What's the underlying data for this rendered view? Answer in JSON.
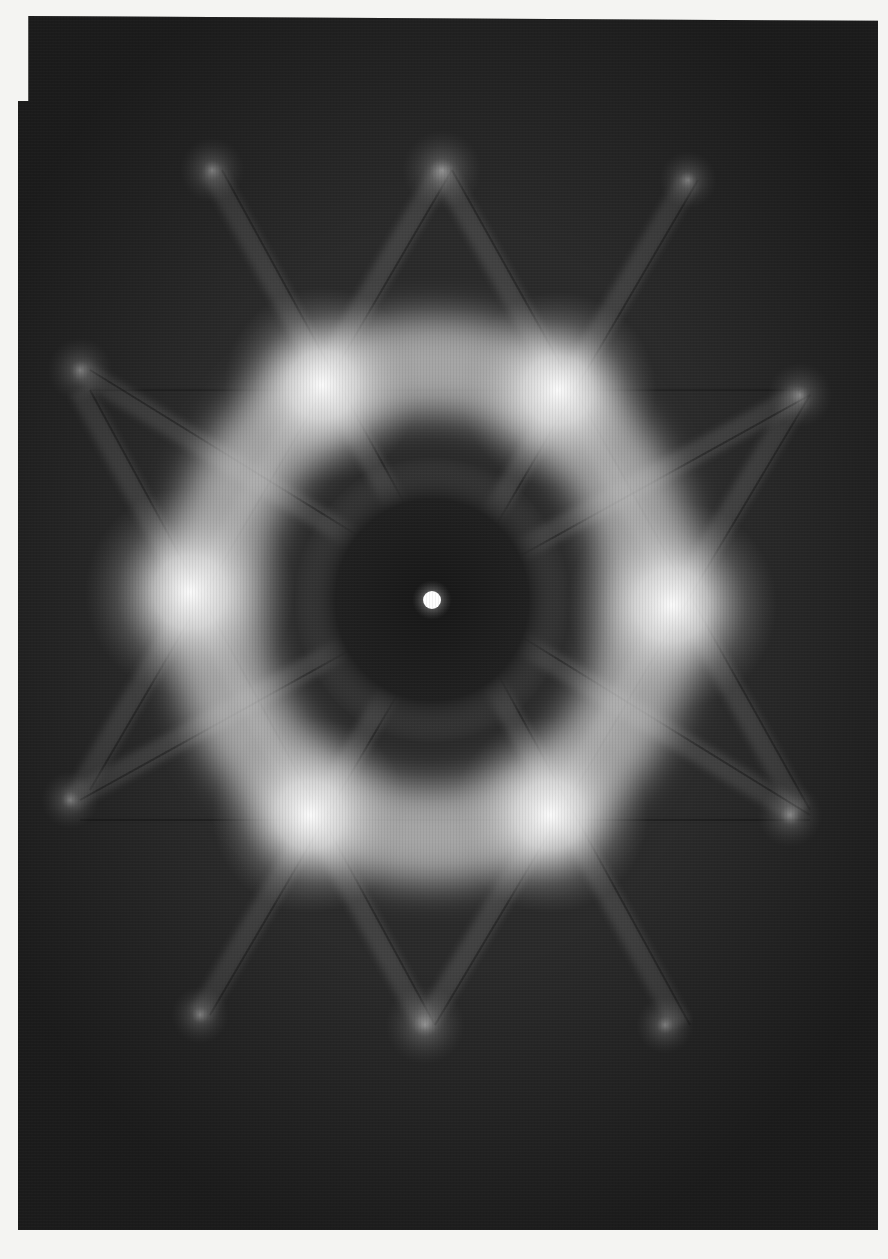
{
  "image": {
    "description": "Electron diffraction (Kikuchi) pattern with six-fold symmetry",
    "background_color": "#2a2a2a",
    "page_color": "#f4f4f2",
    "center": [
      432,
      600
    ],
    "central_spot": {
      "x": 432,
      "y": 600,
      "r": 9
    },
    "dark_core": {
      "x": 432,
      "y": 600,
      "rx": 120,
      "ry": 125,
      "color": "#1c1c1c"
    },
    "bright_ring": {
      "x": 432,
      "y": 600,
      "rx": 250,
      "ry": 265,
      "width": 95
    },
    "inner_spots": [
      {
        "x": 322,
        "y": 385,
        "r": 70
      },
      {
        "x": 558,
        "y": 390,
        "r": 70
      },
      {
        "x": 190,
        "y": 592,
        "r": 75
      },
      {
        "x": 672,
        "y": 605,
        "r": 75
      },
      {
        "x": 310,
        "y": 815,
        "r": 70
      },
      {
        "x": 550,
        "y": 815,
        "r": 70
      }
    ],
    "outer_spots": [
      {
        "x": 442,
        "y": 170,
        "r": 22
      },
      {
        "x": 212,
        "y": 170,
        "r": 18
      },
      {
        "x": 688,
        "y": 180,
        "r": 16
      },
      {
        "x": 80,
        "y": 370,
        "r": 18
      },
      {
        "x": 800,
        "y": 395,
        "r": 18
      },
      {
        "x": 70,
        "y": 800,
        "r": 16
      },
      {
        "x": 790,
        "y": 815,
        "r": 18
      },
      {
        "x": 200,
        "y": 1015,
        "r": 16
      },
      {
        "x": 425,
        "y": 1025,
        "r": 22
      },
      {
        "x": 665,
        "y": 1025,
        "r": 16
      }
    ],
    "kikuchi_lines": [
      [
        442,
        170,
        80,
        790
      ],
      [
        442,
        170,
        800,
        810
      ],
      [
        80,
        390,
        790,
        390
      ],
      [
        70,
        820,
        800,
        820
      ],
      [
        80,
        390,
        425,
        1025
      ],
      [
        800,
        395,
        425,
        1025
      ],
      [
        212,
        170,
        680,
        1025
      ],
      [
        688,
        180,
        200,
        1015
      ],
      [
        80,
        370,
        800,
        815
      ],
      [
        800,
        395,
        70,
        800
      ]
    ]
  }
}
